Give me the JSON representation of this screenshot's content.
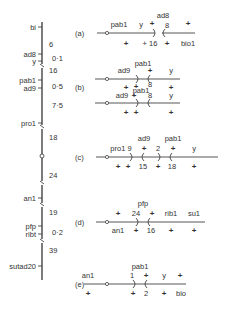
{
  "figure": {
    "type": "genetic map with recombination configurations",
    "chromosome_map": {
      "markers": [
        {
          "name": "bi",
          "y": 27
        },
        {
          "name": "ad8",
          "y": 54
        },
        {
          "name": "y",
          "y": 61
        },
        {
          "name": "pab1",
          "y": 80
        },
        {
          "name": "ad9",
          "y": 88
        },
        {
          "name": "pro1",
          "y": 123
        },
        {
          "name": "an1",
          "y": 198
        },
        {
          "name": "pfp",
          "y": 226
        },
        {
          "name": "ribt",
          "y": 234
        },
        {
          "name": "sutad20",
          "y": 266
        }
      ],
      "distances": [
        {
          "label": "6",
          "y": 44
        },
        {
          "label": "0·1",
          "y": 58
        },
        {
          "label": "16",
          "y": 70
        },
        {
          "label": "0·5",
          "y": 86
        },
        {
          "label": "7·5",
          "y": 105
        },
        {
          "label": "18",
          "y": 137
        },
        {
          "label": "24",
          "y": 175
        },
        {
          "label": "19",
          "y": 212
        },
        {
          "label": "0·2",
          "y": 232
        },
        {
          "label": "39",
          "y": 250
        }
      ],
      "breaks_y": [
        66,
        127,
        183,
        205,
        241
      ],
      "centromere_y": 156
    },
    "panels": [
      {
        "label": "(a)",
        "above": [
          "pab1",
          "y",
          "ad8",
          "+",
          "8",
          "+"
        ],
        "below": [
          "+",
          "+ 16",
          "+",
          "bio1"
        ]
      },
      {
        "label": "(b)",
        "top_above": [
          "pab1",
          "ad9",
          "+",
          "y"
        ],
        "top_below": [
          "+",
          "+",
          "8",
          "+"
        ],
        "bottom_above": [
          "pab1",
          "ad9",
          "+",
          "y"
        ],
        "bottom_below": [
          "+",
          "+",
          "8",
          "+"
        ]
      },
      {
        "label": "(c)",
        "above": [
          "ad9",
          "pab1",
          "pro1 9",
          "+",
          "2",
          "+",
          "y"
        ],
        "below": [
          "+",
          "+",
          "15",
          "+",
          "18",
          "+"
        ]
      },
      {
        "label": "(d)",
        "above": [
          "pfp",
          "+",
          "24",
          "+",
          "rib1",
          "su1"
        ],
        "below": [
          "an1",
          "+",
          "16",
          "+",
          "+"
        ]
      },
      {
        "label": "(e)",
        "above": [
          "pab1",
          "an1",
          "1",
          "+",
          "y",
          "+"
        ],
        "below": [
          "+",
          "+",
          "2",
          "+",
          "bio"
        ]
      }
    ]
  }
}
